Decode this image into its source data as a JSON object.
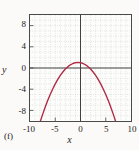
{
  "panel": {
    "label": "(f)"
  },
  "axis_titles": {
    "x": "x",
    "y": "y"
  },
  "chart_data": {
    "type": "line",
    "title": "",
    "subtitle": "",
    "xlabel": "x",
    "ylabel": "y",
    "panel_label": "(f)",
    "xlim": [
      -10,
      10
    ],
    "ylim": [
      -10,
      10
    ],
    "xticks": [
      -10,
      -5,
      0,
      5,
      10
    ],
    "yticks": [
      8,
      4,
      0,
      -4,
      -8
    ],
    "xtick_labels": [
      "-10",
      "-5",
      "0",
      "5",
      "10"
    ],
    "ytick_labels": [
      "8",
      "4",
      "0",
      "-4",
      "-8"
    ],
    "grid": true,
    "grid_style": "dotted",
    "grid_spacing": 1,
    "legend": "none",
    "axis_lines": {
      "x_axis_at_y": 0,
      "y_axis_at_x": 0
    },
    "series": [
      {
        "name": "parabola",
        "color": "#b02a44",
        "equation": "y = -0.2x^2 - 0.2x + 1",
        "vertex": [
          -0.5,
          1.05
        ],
        "opens": "down",
        "x_intercepts": [
          -2.79,
          1.79
        ],
        "visible_x_range": [
          -8.0,
          7.5
        ],
        "x": [
          -8.0,
          -7.5,
          -7.0,
          -6.5,
          -6.0,
          -5.5,
          -5.0,
          -4.5,
          -4.0,
          -3.5,
          -3.0,
          -2.5,
          -2.0,
          -1.5,
          -1.0,
          -0.5,
          0.0,
          0.5,
          1.0,
          1.5,
          2.0,
          2.5,
          3.0,
          3.5,
          4.0,
          4.5,
          5.0,
          5.5,
          6.0,
          6.5,
          7.0,
          7.5
        ],
        "y": [
          -10.2,
          -8.75,
          -7.4,
          -6.15,
          -5.0,
          -3.95,
          -3.0,
          -2.15,
          -1.4,
          -0.75,
          -0.2,
          0.25,
          0.6,
          0.85,
          1.0,
          1.05,
          1.0,
          0.85,
          0.6,
          0.25,
          -0.2,
          -0.75,
          -1.4,
          -2.15,
          -3.0,
          -3.95,
          -5.0,
          -6.15,
          -7.4,
          -8.75,
          -10.2,
          -11.75
        ]
      }
    ]
  }
}
